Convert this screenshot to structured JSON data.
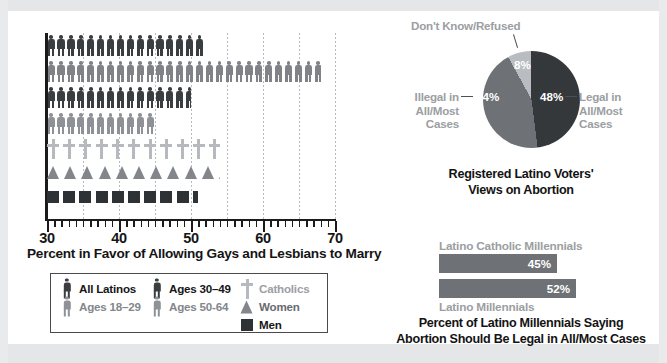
{
  "chart_data": [
    {
      "type": "bar",
      "id": "pictogram-marriage",
      "title": "",
      "xlabel": "Percent in Favor of Allowing Gays and Lesbians to Marry",
      "ylabel": "",
      "xlim": [
        30,
        70
      ],
      "xticks": [
        30,
        40,
        50,
        60,
        70
      ],
      "grid": true,
      "categories": [
        "All Latinos",
        "Ages 18–29",
        "Ages 30–49",
        "Ages 50-64",
        "Catholics",
        "Women",
        "Men"
      ],
      "values": [
        52,
        68,
        50,
        45,
        54,
        54,
        51
      ],
      "glyphs": [
        "person",
        "person",
        "person",
        "person",
        "cross",
        "triangle",
        "square"
      ],
      "colors": [
        "#3b3e41",
        "#7f8388",
        "#3b3e41",
        "#8e9297",
        "#b6b9bd",
        "#82868b",
        "#2f3234"
      ]
    },
    {
      "type": "pie",
      "id": "abortion-views-pie",
      "title": "Registered Latino Voters' Views on Abortion",
      "labels": [
        "Legal in All/Most Cases",
        "Illegal in All/Most Cases",
        "Don't Know/Refused"
      ],
      "values": [
        48,
        44,
        8
      ],
      "value_labels": [
        "48%",
        "44%",
        "8%"
      ],
      "colors": [
        "#35383b",
        "#6e7276",
        "#b9bcc0"
      ],
      "legend": "callout-labels"
    },
    {
      "type": "bar",
      "id": "millennials-abortion-bars",
      "title": "Percent of Latino Millennials Saying Abortion Should Be Legal in All/Most Cases",
      "orientation": "horizontal",
      "categories": [
        "Latino Catholic Millennials",
        "Latino Millennials"
      ],
      "values": [
        45,
        52
      ],
      "value_labels": [
        "45%",
        "52%"
      ],
      "colors": [
        "#6e7276",
        "#6e7276"
      ]
    }
  ],
  "picto_chart": {
    "axis_title": "Percent in Favor of Allowing Gays and Lesbians to Marry",
    "ticks": [
      {
        "value": "30"
      },
      {
        "value": "40"
      },
      {
        "value": "50"
      },
      {
        "value": "60"
      },
      {
        "value": "70"
      }
    ],
    "rows": [
      {
        "label": "All Latinos",
        "value": 52
      },
      {
        "label": "Ages 18–29",
        "value": 68
      },
      {
        "label": "Ages 30–49",
        "value": 50
      },
      {
        "label": "Ages 50-64",
        "value": 45
      },
      {
        "label": "Catholics",
        "value": 54
      },
      {
        "label": "Women",
        "value": 54
      },
      {
        "label": "Men",
        "value": 51
      }
    ]
  },
  "legend": {
    "columns": [
      [
        {
          "label": "All Latinos",
          "glyph": "person",
          "color": "#3b3e41",
          "text_color": "#161616"
        },
        {
          "label": "Ages 18–29",
          "glyph": "person",
          "color": "#8e9297",
          "text_color": "#83878c"
        }
      ],
      [
        {
          "label": "Ages 30–49",
          "glyph": "person",
          "color": "#3b3e41",
          "text_color": "#161616"
        },
        {
          "label": "Ages 50-64",
          "glyph": "person",
          "color": "#8e9297",
          "text_color": "#83878c"
        }
      ],
      [
        {
          "label": "Catholics",
          "glyph": "cross",
          "color": "#b6b9bd",
          "text_color": "#9ca0a4"
        },
        {
          "label": "Women",
          "glyph": "triangle",
          "color": "#82868b",
          "text_color": "#676b70"
        },
        {
          "label": "Men",
          "glyph": "square",
          "color": "#2f3234",
          "text_color": "#161616"
        }
      ]
    ]
  },
  "pie": {
    "caption_line1": "Registered Latino Voters'",
    "caption_line2": "Views on Abortion",
    "slices": [
      {
        "name": "legal",
        "pct": "48%",
        "label_line1": "Legal in",
        "label_line2": "All/Most",
        "label_line3": "Cases",
        "color": "#35383b"
      },
      {
        "name": "illegal",
        "pct": "44%",
        "label_line1": "Illegal in",
        "label_line2": "All/Most",
        "label_line3": "Cases",
        "color": "#6e7276"
      },
      {
        "name": "dont-know",
        "pct": "8%",
        "label_line1": "Don't Know/Refused",
        "color": "#b9bcc0"
      }
    ]
  },
  "bars": {
    "top_label": "Latino Catholic Millennials",
    "bottom_label": "Latino Millennials",
    "top_value": "45%",
    "bottom_value": "52%",
    "caption_line1": "Percent of Latino Millennials Saying",
    "caption_line2": "Abortion Should Be Legal in All/Most Cases"
  }
}
